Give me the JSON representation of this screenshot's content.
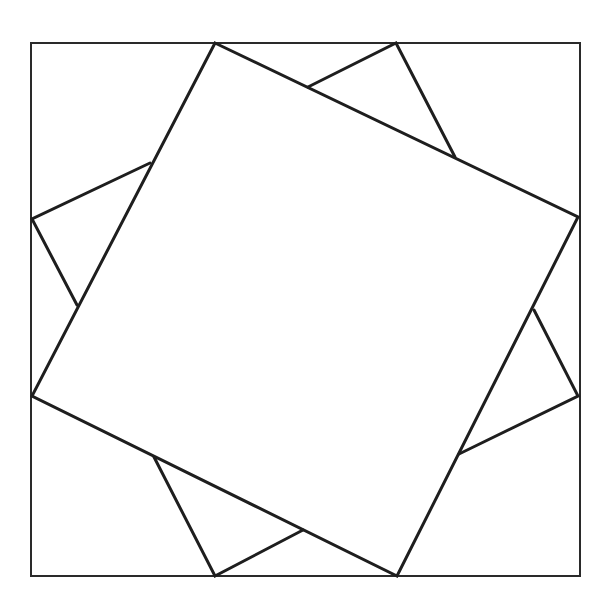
{
  "diagram": {
    "stroke_color": "#1e1e1e",
    "frame_color": "#2a2a2a",
    "background": "#ffffff",
    "outer_square": [
      [
        31,
        43
      ],
      [
        580,
        43
      ],
      [
        580,
        576
      ],
      [
        31,
        576
      ]
    ],
    "front_square": [
      [
        215,
        43
      ],
      [
        578,
        217
      ],
      [
        397,
        576
      ],
      [
        32,
        396
      ]
    ],
    "back_square_visible_segments": [
      [
        [
          308,
          87
        ],
        [
          396,
          43
        ],
        [
          455,
          157
        ]
      ],
      [
        [
          534,
          310
        ],
        [
          578,
          396
        ],
        [
          459,
          454
        ]
      ],
      [
        [
          303,
          530
        ],
        [
          215,
          576
        ],
        [
          154,
          457
        ]
      ],
      [
        [
          77,
          305
        ],
        [
          32,
          219
        ],
        [
          150,
          163
        ]
      ]
    ]
  }
}
